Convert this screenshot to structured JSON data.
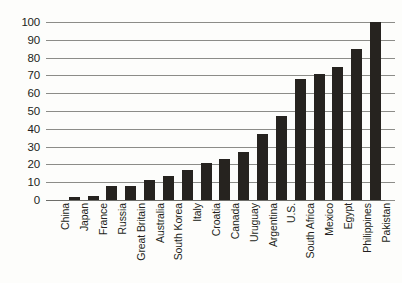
{
  "chart_data": {
    "type": "bar",
    "title": "",
    "subtitle": "",
    "xlabel": "",
    "ylabel": "",
    "ylim": [
      0,
      100
    ],
    "ytick_step": 10,
    "ytick_labels": [
      "100",
      "90",
      "80",
      "70",
      "60",
      "50",
      "40",
      "30",
      "20",
      "10",
      "0"
    ],
    "grid": true,
    "legend": false,
    "legend_position": "none",
    "bar_color": "#26231f",
    "gridline_color": "#8c8c88",
    "background_color": "#fdfdfb",
    "orientation": "vertical",
    "xtick_rotation": -90,
    "categories": [
      "China",
      "Japan",
      "France",
      "Russia",
      "Great Britain",
      "Australia",
      "South Korea",
      "Italy",
      "Croatia",
      "Canada",
      "Uruguay",
      "Argentina",
      "U.S.",
      "South Africa",
      "Mexico",
      "Egypt",
      "Philippines",
      "Pakistan"
    ],
    "values": [
      0,
      1.5,
      2.5,
      8,
      8,
      11,
      13.5,
      17,
      21,
      23,
      27,
      37,
      47,
      68,
      71,
      75,
      85,
      100
    ]
  }
}
